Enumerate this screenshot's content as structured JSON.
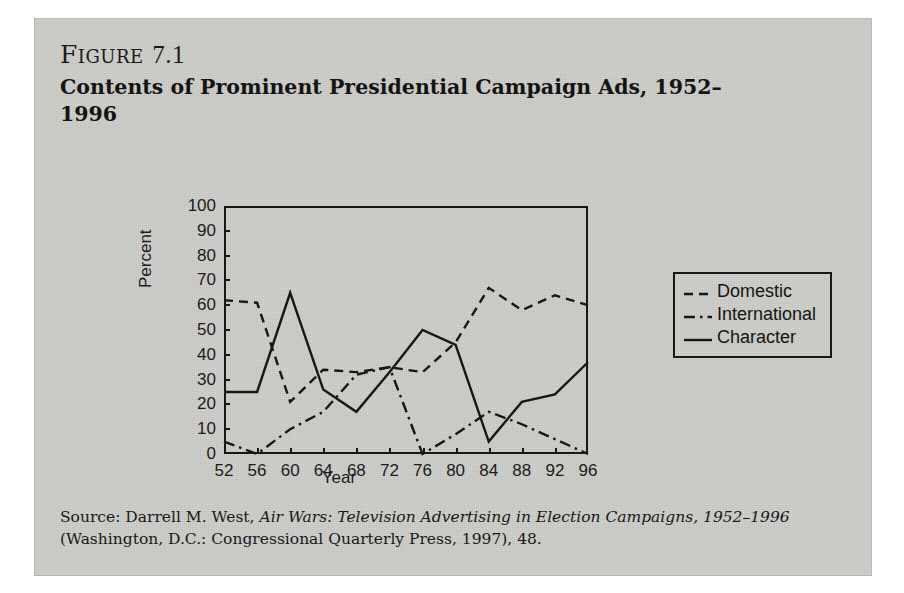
{
  "figure": {
    "label": "Figure",
    "number": "7.1",
    "title": "Contents of Prominent Presidential Campaign Ads, 1952–1996"
  },
  "source": {
    "prefix": "Source: Darrell M. West, ",
    "italic_title": "Air Wars: Television Advertising in Election Campaigns, 1952–1996",
    "suffix": " (Washington, D.C.: Congressional Quarterly Press, 1997), 48."
  },
  "legend": {
    "items": [
      {
        "label": "Domestic",
        "style": "dashed"
      },
      {
        "label": "International",
        "style": "dash-dot"
      },
      {
        "label": "Character",
        "style": "solid"
      }
    ]
  },
  "chart_data": {
    "type": "line",
    "title": "Contents of Prominent Presidential Campaign Ads, 1952–1996",
    "xlabel": "Year",
    "ylabel": "Percent",
    "categories": [
      "52",
      "56",
      "60",
      "64",
      "68",
      "72",
      "76",
      "80",
      "84",
      "88",
      "92",
      "96"
    ],
    "x": [
      1952,
      1956,
      1960,
      1964,
      1968,
      1972,
      1976,
      1980,
      1984,
      1988,
      1992,
      1996
    ],
    "ylim": [
      0,
      100
    ],
    "yticks": [
      0,
      10,
      20,
      30,
      40,
      50,
      60,
      70,
      80,
      90,
      100
    ],
    "grid": false,
    "legend_position": "right",
    "series": [
      {
        "name": "Domestic",
        "style": "dashed",
        "values": [
          62,
          61,
          21,
          34,
          33,
          35,
          33,
          45,
          67,
          58,
          64,
          60
        ]
      },
      {
        "name": "International",
        "style": "dash-dot",
        "values": [
          5,
          0,
          10,
          17,
          32,
          35,
          0,
          8,
          17,
          12,
          6,
          0
        ]
      },
      {
        "name": "Character",
        "style": "solid",
        "values": [
          25,
          25,
          65,
          26,
          17,
          33,
          50,
          44,
          5,
          21,
          24,
          37
        ]
      }
    ]
  }
}
